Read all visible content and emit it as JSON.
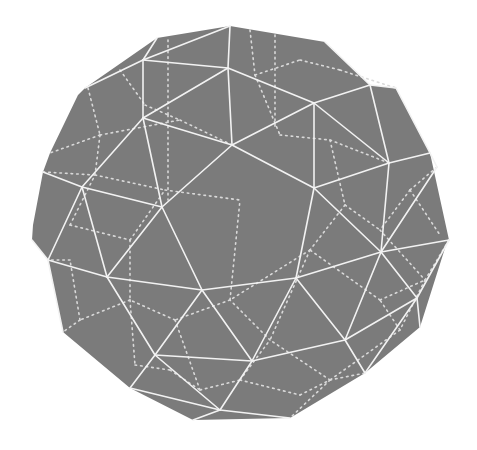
{
  "figure": {
    "colors": {
      "background": "#ffffff",
      "face_fill": "#7b7b7b",
      "visible_edge": "#f2f2f2",
      "hidden_edge": "#d9d9d9"
    },
    "outline": [
      [
        157,
        38
      ],
      [
        230,
        26
      ],
      [
        325,
        42
      ],
      [
        370,
        85
      ],
      [
        396,
        88
      ],
      [
        430,
        153
      ],
      [
        449,
        240
      ],
      [
        446,
        245
      ],
      [
        420,
        327
      ],
      [
        365,
        373
      ],
      [
        290,
        418
      ],
      [
        193,
        420
      ],
      [
        130,
        388
      ],
      [
        63,
        332
      ],
      [
        48,
        260
      ],
      [
        32,
        240
      ],
      [
        33,
        225
      ],
      [
        43,
        172
      ],
      [
        50,
        153
      ],
      [
        78,
        95
      ],
      [
        85,
        88
      ]
    ],
    "visible_edges": [
      [
        [
          157,
          38
        ],
        [
          143,
          60
        ]
      ],
      [
        [
          143,
          60
        ],
        [
          230,
          26
        ]
      ],
      [
        [
          230,
          26
        ],
        [
          228,
          68
        ]
      ],
      [
        [
          143,
          60
        ],
        [
          228,
          68
        ]
      ],
      [
        [
          85,
          88
        ],
        [
          143,
          60
        ]
      ],
      [
        [
          143,
          60
        ],
        [
          143,
          118
        ]
      ],
      [
        [
          228,
          68
        ],
        [
          143,
          118
        ]
      ],
      [
        [
          228,
          68
        ],
        [
          232,
          145
        ]
      ],
      [
        [
          143,
          118
        ],
        [
          232,
          145
        ]
      ],
      [
        [
          228,
          68
        ],
        [
          314,
          103
        ]
      ],
      [
        [
          314,
          103
        ],
        [
          232,
          145
        ]
      ],
      [
        [
          325,
          42
        ],
        [
          370,
          85
        ]
      ],
      [
        [
          370,
          85
        ],
        [
          396,
          88
        ]
      ],
      [
        [
          370,
          85
        ],
        [
          314,
          103
        ]
      ],
      [
        [
          370,
          85
        ],
        [
          389,
          163
        ]
      ],
      [
        [
          396,
          88
        ],
        [
          430,
          153
        ]
      ],
      [
        [
          314,
          103
        ],
        [
          389,
          163
        ]
      ],
      [
        [
          389,
          163
        ],
        [
          430,
          153
        ]
      ],
      [
        [
          314,
          103
        ],
        [
          314,
          188
        ]
      ],
      [
        [
          232,
          145
        ],
        [
          314,
          188
        ]
      ],
      [
        [
          389,
          163
        ],
        [
          314,
          188
        ]
      ],
      [
        [
          143,
          118
        ],
        [
          82,
          187
        ]
      ],
      [
        [
          143,
          118
        ],
        [
          162,
          207
        ]
      ],
      [
        [
          82,
          187
        ],
        [
          162,
          207
        ]
      ],
      [
        [
          232,
          145
        ],
        [
          162,
          207
        ]
      ],
      [
        [
          43,
          172
        ],
        [
          82,
          187
        ]
      ],
      [
        [
          82,
          187
        ],
        [
          48,
          260
        ]
      ],
      [
        [
          48,
          260
        ],
        [
          32,
          240
        ]
      ],
      [
        [
          82,
          187
        ],
        [
          107,
          277
        ]
      ],
      [
        [
          162,
          207
        ],
        [
          107,
          277
        ]
      ],
      [
        [
          162,
          207
        ],
        [
          202,
          290
        ]
      ],
      [
        [
          48,
          260
        ],
        [
          107,
          277
        ]
      ],
      [
        [
          107,
          277
        ],
        [
          202,
          290
        ]
      ],
      [
        [
          314,
          188
        ],
        [
          296,
          278
        ]
      ],
      [
        [
          389,
          163
        ],
        [
          381,
          252
        ]
      ],
      [
        [
          430,
          153
        ],
        [
          437,
          167
        ]
      ],
      [
        [
          437,
          167
        ],
        [
          381,
          252
        ]
      ],
      [
        [
          314,
          188
        ],
        [
          381,
          252
        ]
      ],
      [
        [
          202,
          290
        ],
        [
          296,
          278
        ]
      ],
      [
        [
          296,
          278
        ],
        [
          381,
          252
        ]
      ],
      [
        [
          381,
          252
        ],
        [
          449,
          240
        ]
      ],
      [
        [
          381,
          252
        ],
        [
          417,
          298
        ]
      ],
      [
        [
          449,
          240
        ],
        [
          417,
          298
        ]
      ],
      [
        [
          417,
          298
        ],
        [
          420,
          327
        ]
      ],
      [
        [
          296,
          278
        ],
        [
          345,
          340
        ]
      ],
      [
        [
          381,
          252
        ],
        [
          345,
          340
        ]
      ],
      [
        [
          345,
          340
        ],
        [
          417,
          298
        ]
      ],
      [
        [
          417,
          298
        ],
        [
          365,
          373
        ]
      ],
      [
        [
          345,
          340
        ],
        [
          365,
          373
        ]
      ],
      [
        [
          48,
          260
        ],
        [
          63,
          332
        ]
      ],
      [
        [
          107,
          277
        ],
        [
          155,
          355
        ]
      ],
      [
        [
          202,
          290
        ],
        [
          155,
          355
        ]
      ],
      [
        [
          202,
          290
        ],
        [
          252,
          361
        ]
      ],
      [
        [
          296,
          278
        ],
        [
          252,
          361
        ]
      ],
      [
        [
          155,
          355
        ],
        [
          252,
          361
        ]
      ],
      [
        [
          252,
          361
        ],
        [
          345,
          340
        ]
      ],
      [
        [
          155,
          355
        ],
        [
          130,
          388
        ]
      ],
      [
        [
          155,
          355
        ],
        [
          220,
          410
        ]
      ],
      [
        [
          252,
          361
        ],
        [
          220,
          410
        ]
      ],
      [
        [
          130,
          388
        ],
        [
          220,
          410
        ]
      ],
      [
        [
          220,
          410
        ],
        [
          193,
          420
        ]
      ],
      [
        [
          220,
          410
        ],
        [
          290,
          418
        ]
      ]
    ],
    "hidden_edges": [
      [
        [
          88,
          88
        ],
        [
          100,
          135
        ]
      ],
      [
        [
          100,
          135
        ],
        [
          50,
          153
        ]
      ],
      [
        [
          100,
          135
        ],
        [
          180,
          120
        ]
      ],
      [
        [
          180,
          120
        ],
        [
          232,
          145
        ]
      ],
      [
        [
          100,
          135
        ],
        [
          95,
          175
        ]
      ],
      [
        [
          95,
          175
        ],
        [
          43,
          172
        ]
      ],
      [
        [
          95,
          175
        ],
        [
          165,
          190
        ]
      ],
      [
        [
          165,
          190
        ],
        [
          240,
          200
        ]
      ],
      [
        [
          120,
          70
        ],
        [
          145,
          105
        ]
      ],
      [
        [
          145,
          105
        ],
        [
          180,
          120
        ]
      ],
      [
        [
          168,
          40
        ],
        [
          168,
          115
        ]
      ],
      [
        [
          168,
          115
        ],
        [
          168,
          200
        ]
      ],
      [
        [
          250,
          30
        ],
        [
          255,
          75
        ]
      ],
      [
        [
          255,
          75
        ],
        [
          300,
          60
        ]
      ],
      [
        [
          300,
          60
        ],
        [
          340,
          70
        ]
      ],
      [
        [
          340,
          70
        ],
        [
          396,
          88
        ]
      ],
      [
        [
          255,
          75
        ],
        [
          280,
          135
        ]
      ],
      [
        [
          280,
          135
        ],
        [
          330,
          140
        ]
      ],
      [
        [
          330,
          140
        ],
        [
          389,
          163
        ]
      ],
      [
        [
          275,
          35
        ],
        [
          275,
          130
        ]
      ],
      [
        [
          330,
          140
        ],
        [
          345,
          205
        ]
      ],
      [
        [
          345,
          205
        ],
        [
          380,
          230
        ]
      ],
      [
        [
          345,
          205
        ],
        [
          310,
          250
        ]
      ],
      [
        [
          410,
          190
        ],
        [
          437,
          167
        ]
      ],
      [
        [
          410,
          190
        ],
        [
          440,
          235
        ]
      ],
      [
        [
          410,
          190
        ],
        [
          380,
          230
        ]
      ],
      [
        [
          380,
          230
        ],
        [
          425,
          280
        ]
      ],
      [
        [
          425,
          280
        ],
        [
          449,
          240
        ]
      ],
      [
        [
          425,
          280
        ],
        [
          400,
          330
        ]
      ],
      [
        [
          400,
          330
        ],
        [
          330,
          380
        ]
      ],
      [
        [
          330,
          380
        ],
        [
          365,
          373
        ]
      ],
      [
        [
          330,
          380
        ],
        [
          290,
          418
        ]
      ],
      [
        [
          330,
          380
        ],
        [
          270,
          340
        ]
      ],
      [
        [
          270,
          340
        ],
        [
          230,
          300
        ]
      ],
      [
        [
          230,
          300
        ],
        [
          175,
          320
        ]
      ],
      [
        [
          175,
          320
        ],
        [
          130,
          300
        ]
      ],
      [
        [
          130,
          300
        ],
        [
          80,
          320
        ]
      ],
      [
        [
          80,
          320
        ],
        [
          63,
          332
        ]
      ],
      [
        [
          80,
          320
        ],
        [
          70,
          260
        ]
      ],
      [
        [
          70,
          260
        ],
        [
          48,
          260
        ]
      ],
      [
        [
          175,
          320
        ],
        [
          200,
          390
        ]
      ],
      [
        [
          200,
          390
        ],
        [
          240,
          380
        ]
      ],
      [
        [
          240,
          380
        ],
        [
          270,
          340
        ]
      ],
      [
        [
          130,
          300
        ],
        [
          135,
          365
        ]
      ],
      [
        [
          135,
          365
        ],
        [
          170,
          370
        ]
      ],
      [
        [
          170,
          370
        ],
        [
          200,
          390
        ]
      ],
      [
        [
          240,
          380
        ],
        [
          300,
          395
        ]
      ],
      [
        [
          300,
          395
        ],
        [
          330,
          380
        ]
      ],
      [
        [
          70,
          225
        ],
        [
          95,
          175
        ]
      ],
      [
        [
          70,
          225
        ],
        [
          130,
          240
        ]
      ],
      [
        [
          130,
          240
        ],
        [
          165,
          190
        ]
      ],
      [
        [
          130,
          240
        ],
        [
          130,
          300
        ]
      ],
      [
        [
          230,
          300
        ],
        [
          240,
          200
        ]
      ],
      [
        [
          310,
          250
        ],
        [
          230,
          300
        ]
      ],
      [
        [
          310,
          250
        ],
        [
          270,
          340
        ]
      ],
      [
        [
          400,
          330
        ],
        [
          380,
          300
        ]
      ],
      [
        [
          380,
          300
        ],
        [
          310,
          250
        ]
      ],
      [
        [
          380,
          300
        ],
        [
          425,
          280
        ]
      ]
    ]
  }
}
